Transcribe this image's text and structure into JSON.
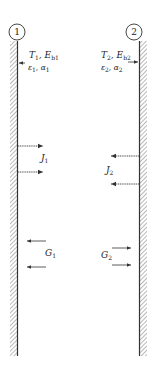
{
  "diagram": {
    "type": "two parallel infinite plates radiation exchange",
    "surfaces": [
      {
        "id": "1",
        "label_number": "1",
        "side": "left",
        "props_line1": {
          "T": "T",
          "T_sub": "1",
          "E": "E",
          "E_sub": "b1"
        },
        "props_line2": {
          "eps": "ε",
          "eps_sub": "1",
          "alpha": "α",
          "alpha_sub": "1"
        },
        "radiosity": {
          "symbol": "J",
          "sub": "1",
          "direction": "right"
        },
        "irradiation": {
          "symbol": "G",
          "sub": "1",
          "direction": "left"
        }
      },
      {
        "id": "2",
        "label_number": "2",
        "side": "right",
        "props_line1": {
          "T": "T",
          "T_sub": "2",
          "E": "E",
          "E_sub": "b2"
        },
        "props_line2": {
          "eps": "ε",
          "eps_sub": "2",
          "alpha": "α",
          "alpha_sub": "2"
        },
        "radiosity": {
          "symbol": "J",
          "sub": "2",
          "direction": "left"
        },
        "irradiation": {
          "symbol": "G",
          "sub": "2",
          "direction": "right"
        }
      }
    ],
    "colors": {
      "line": "#333333",
      "hatch": "#888888",
      "background": "#ffffff"
    }
  }
}
